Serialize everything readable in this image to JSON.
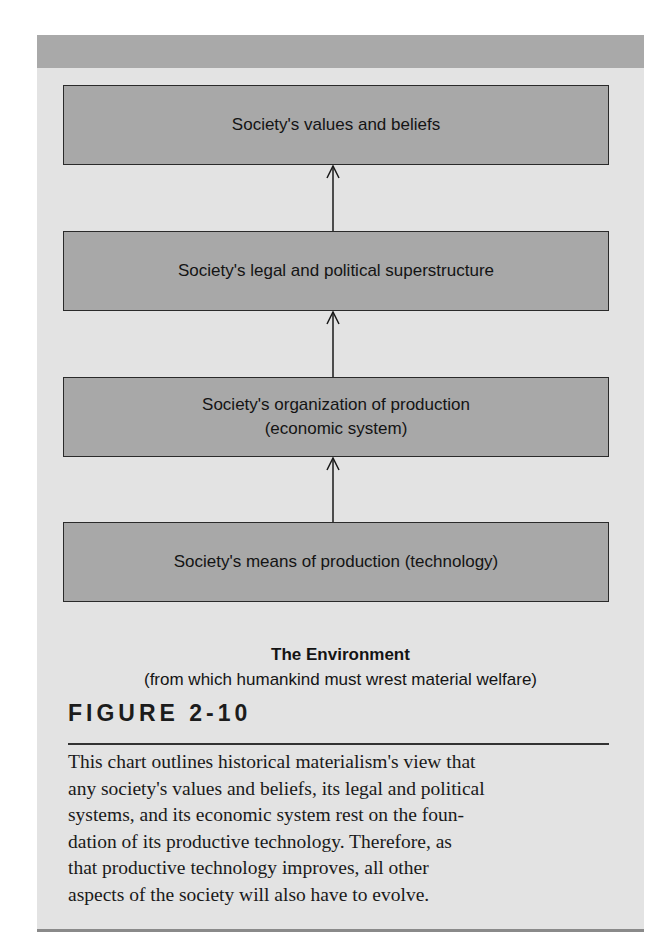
{
  "diagram": {
    "boxes": [
      {
        "line1": "Society's values and beliefs",
        "line2": ""
      },
      {
        "line1": "Society's legal and political superstructure",
        "line2": ""
      },
      {
        "line1": "Society's organization of production",
        "line2": "(economic system)"
      },
      {
        "line1": "Society's means of production (technology)",
        "line2": ""
      }
    ],
    "environment_title": "The Environment",
    "environment_subtitle": "(from which humankind must wrest material welfare)"
  },
  "figure": {
    "label": "FIGURE 2-10",
    "caption": "This chart outlines historical materialism's view that\nany society's values and beliefs, its legal and political\nsystems, and its economic system rest on the foun-\ndation of its productive technology. Therefore, as\nthat productive technology improves, all other\naspects of the society will also have to evolve."
  },
  "colors": {
    "panel": "#e3e3e3",
    "band": "#a9a9a9",
    "box": "#a8a8a8",
    "stroke": "#2a2a2a"
  }
}
